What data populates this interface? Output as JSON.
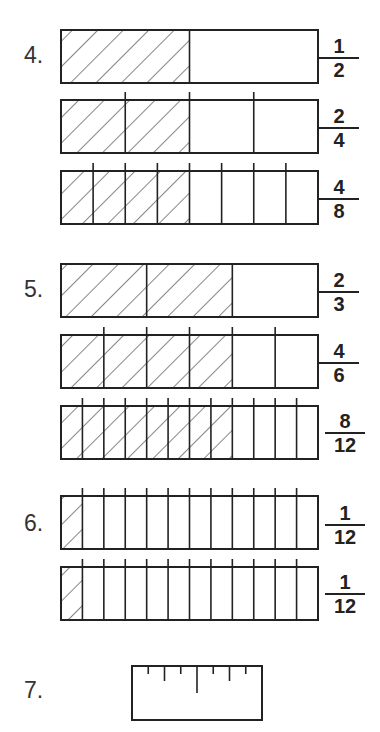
{
  "problems": [
    {
      "number": "4.",
      "bars": [
        {
          "parts": 2,
          "shaded": 1,
          "ticks": false,
          "fraction": {
            "num": "1",
            "den": "2"
          }
        },
        {
          "parts": 4,
          "shaded": 2,
          "ticks": true,
          "fraction": {
            "num": "2",
            "den": "4"
          }
        },
        {
          "parts": 8,
          "shaded": 4,
          "ticks": true,
          "fraction": {
            "num": "4",
            "den": "8"
          }
        }
      ]
    },
    {
      "number": "5.",
      "bars": [
        {
          "parts": 3,
          "shaded": 2,
          "ticks": false,
          "fraction": {
            "num": "2",
            "den": "3"
          }
        },
        {
          "parts": 6,
          "shaded": 4,
          "ticks": true,
          "fraction": {
            "num": "4",
            "den": "6"
          }
        },
        {
          "parts": 12,
          "shaded": 8,
          "ticks": true,
          "fraction": {
            "num": "8",
            "den": "12"
          }
        }
      ]
    },
    {
      "number": "6.",
      "bars": [
        {
          "parts": 12,
          "shaded": 1,
          "ticks": true,
          "fraction": {
            "num": "1",
            "den": "12"
          }
        },
        {
          "parts": 12,
          "shaded": 1,
          "ticks": true,
          "fraction": {
            "num": "1",
            "den": "12"
          }
        }
      ]
    },
    {
      "number": "7.",
      "ruler": {
        "ticks": 7
      }
    }
  ],
  "colors": {
    "stroke": "#222222",
    "hatch": "#333333",
    "background": "#ffffff"
  }
}
